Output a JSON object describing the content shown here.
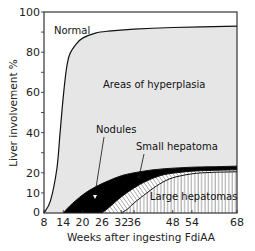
{
  "chart_data": {
    "type": "area",
    "title": "",
    "xlabel": "Weeks after ingesting FdiAA",
    "ylabel": "Liver involvement %",
    "x_ticks": [
      8,
      14,
      20,
      26,
      32,
      36,
      48,
      54,
      68
    ],
    "y_ticks": [
      10,
      20,
      40,
      60,
      80,
      100
    ],
    "y_minor_ticks": [
      30,
      50,
      70,
      90
    ],
    "xlim": [
      8,
      68
    ],
    "ylim": [
      0,
      100
    ],
    "grid": false,
    "legend": "none (regions labeled inline)",
    "series": [
      {
        "name": "Normal / Areas of hyperplasia boundary",
        "x": [
          8,
          10,
          12,
          13,
          14,
          15,
          16,
          18,
          20,
          24,
          28,
          36,
          48,
          68
        ],
        "values": [
          0,
          6,
          22,
          40,
          58,
          72,
          79,
          84,
          87,
          89.5,
          90.5,
          91.5,
          92.3,
          93
        ]
      },
      {
        "name": "Nodules (top)",
        "x": [
          14,
          16,
          20,
          24,
          28,
          32,
          36,
          42,
          48,
          54,
          60,
          68
        ],
        "values": [
          0,
          3.5,
          9,
          13,
          16,
          18.5,
          20,
          21.5,
          22.3,
          22.8,
          23,
          23.3
        ]
      },
      {
        "name": "Small hepatoma (top)",
        "x": [
          26,
          28,
          32,
          36,
          40,
          44,
          48,
          54,
          60,
          68
        ],
        "values": [
          0,
          2.5,
          8,
          12.5,
          16,
          18.5,
          19.8,
          20.8,
          21.2,
          21.5
        ]
      },
      {
        "name": "Large hepatomas (top)",
        "x": [
          32,
          34,
          36,
          40,
          44,
          48,
          54,
          60,
          68
        ],
        "values": [
          0,
          2,
          5,
          10,
          14.5,
          17.5,
          19.5,
          20.2,
          20.5
        ]
      }
    ],
    "region_labels": [
      "Normal",
      "Areas of hyperplasia",
      "Nodules",
      "Small hepatoma",
      "Large hepatomas"
    ],
    "colors": {
      "hyperplasia_fill": "#e6e6e6",
      "nodules_fill": "#000000",
      "line": "#111111",
      "background": "#ffffff"
    }
  },
  "labels": {
    "normal": "Normal",
    "hyperplasia": "Areas of hyperplasia",
    "nodules": "Nodules",
    "small_hepatoma": "Small hepatoma",
    "large_hepatomas": "Large hepatomas",
    "xlabel": "Weeks after ingesting FdiAA",
    "ylabel": "Liver involvement %"
  }
}
